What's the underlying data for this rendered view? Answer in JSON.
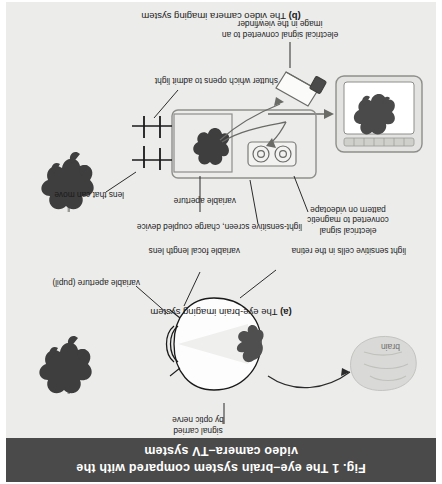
{
  "figure": {
    "title_line1": "Fig. 1  The eye–brain system compared with the",
    "title_line2": "video camera–TV system",
    "title_bar_color": "#4a4a4a",
    "title_text_color": "#ffffff",
    "page_background": "#ececeb",
    "ink_color": "#1a1a1a",
    "orientation": "rotated-180"
  },
  "panel_a": {
    "caption_label": "(a)",
    "caption_text": "The eye-brain imaging system",
    "labels": {
      "variable_aperture": "variable aperture (pupil)",
      "signal_optic_nerve_line1": "signal carried",
      "signal_optic_nerve_line2": "by optic nerve",
      "variable_focal_length_lens": "variable focal length lens",
      "light_sensitive_cells": "light sensitive cells in the retina",
      "brain": "brain"
    }
  },
  "panel_b": {
    "caption_label": "(b)",
    "caption_text": "The video camera imaging system",
    "labels": {
      "ccd_screen": "light-sensitive screen, charge coupled device",
      "variable_aperture": "variable aperture",
      "lens_that_can_move": "lens that can move",
      "shutter": "shutter which opens to admit light",
      "electrical_signal_videotape_line1": "electrical signal",
      "electrical_signal_videotape_line2": "converted to magnetic",
      "electrical_signal_videotape_line3": "pattern on videotape",
      "viewfinder_line1": "electrical signal converted to an",
      "viewfinder_line2": "image in the viewfinder"
    }
  }
}
